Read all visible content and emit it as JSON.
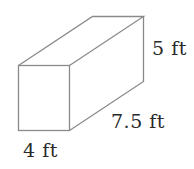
{
  "diagram": {
    "type": "rectangular-prism",
    "stroke_color": "#8a8a8a",
    "text_color": "#2a2a2a",
    "labels": {
      "height": "5 ft",
      "depth": "7.5 ft",
      "width": "4 ft"
    }
  }
}
